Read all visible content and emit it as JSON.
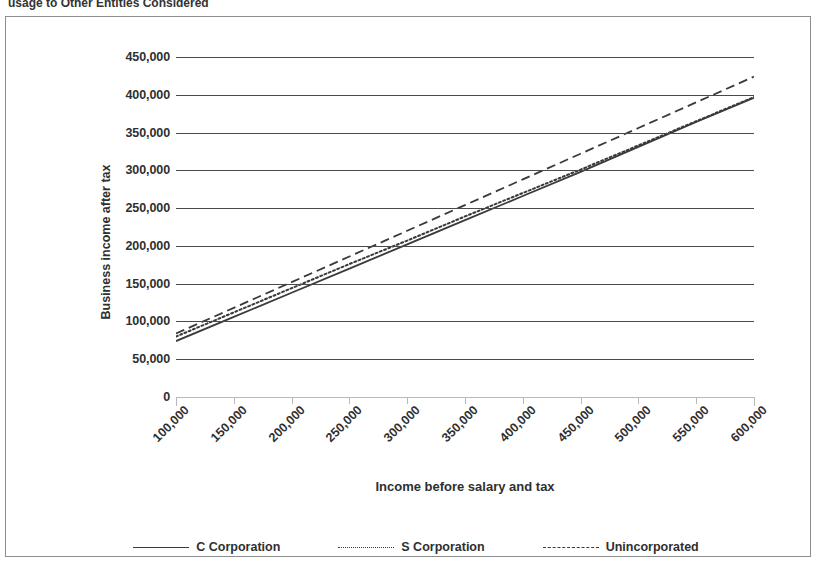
{
  "caption": "usage to Other Entitles Considered",
  "chart_data": {
    "type": "line",
    "title": "",
    "xlabel": "Income before salary and tax",
    "ylabel": "Business income after tax",
    "xlim": [
      100000,
      600000
    ],
    "ylim": [
      0,
      450000
    ],
    "grid": true,
    "legend_position": "bottom",
    "x": [
      100000,
      150000,
      200000,
      250000,
      300000,
      350000,
      400000,
      450000,
      500000,
      550000,
      600000
    ],
    "xtick_labels": [
      "100,000",
      "150,000",
      "200,000",
      "250,000",
      "300,000",
      "350,000",
      "400,000",
      "450,000",
      "500,000",
      "550,000",
      "600,000"
    ],
    "ytick_labels": [
      "0",
      "50,000",
      "100,000",
      "150,000",
      "200,000",
      "250,000",
      "300,000",
      "350,000",
      "400,000",
      "450,000"
    ],
    "ytick_values": [
      0,
      50000,
      100000,
      150000,
      200000,
      250000,
      300000,
      350000,
      400000,
      450000
    ],
    "series": [
      {
        "name": "C Corporation",
        "style": "solid",
        "color": "#3a3a3a",
        "values": [
          74000,
          106000,
          138000,
          170000,
          202000,
          234000,
          266000,
          298000,
          331000,
          364000,
          396000
        ]
      },
      {
        "name": "S Corporation",
        "style": "dotted",
        "color": "#3a3a3a",
        "values": [
          80000,
          112000,
          144000,
          176000,
          207000,
          239000,
          270000,
          301000,
          333000,
          365000,
          397000
        ]
      },
      {
        "name": "Unincorporated",
        "style": "dashed",
        "color": "#3a3a3a",
        "values": [
          84000,
          118000,
          152000,
          186000,
          220000,
          254000,
          288000,
          322000,
          356000,
          390000,
          424000
        ]
      }
    ]
  }
}
